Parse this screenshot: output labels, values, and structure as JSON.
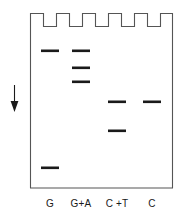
{
  "figure": {
    "colors": {
      "outline": "#555555",
      "band": "#1a1a1a",
      "arrow": "#1a1a1a",
      "label": "#1a1a1a",
      "background": "#ffffff"
    }
  },
  "gel": {
    "box": {
      "x": 30,
      "y": 13,
      "width": 143,
      "height": 175
    },
    "comb": {
      "teeth_count": 5,
      "notch_depth": 13,
      "description": "castellated well comb along top edge"
    }
  },
  "arrow": {
    "name": "migration-direction-arrow",
    "direction": "down",
    "x": 14,
    "y_top": 85,
    "y_bottom": 112
  },
  "lanes": [
    {
      "label": "G",
      "center_x": 50,
      "bands": [
        {
          "y": 51,
          "width": 18
        },
        {
          "y": 168,
          "width": 18
        }
      ]
    },
    {
      "label": "G+A",
      "center_x": 81,
      "bands": [
        {
          "y": 51,
          "width": 18
        },
        {
          "y": 68,
          "width": 18
        },
        {
          "y": 82,
          "width": 18
        }
      ]
    },
    {
      "label": "C +T",
      "center_x": 117,
      "bands": [
        {
          "y": 102,
          "width": 18
        },
        {
          "y": 131,
          "width": 18
        }
      ]
    },
    {
      "label": "C",
      "center_x": 152,
      "bands": [
        {
          "y": 102,
          "width": 18
        }
      ]
    }
  ],
  "labels_row": {
    "y": 204,
    "items": [
      {
        "text": "G",
        "center_x": 50
      },
      {
        "text": "G+A",
        "center_x": 81
      },
      {
        "text": "C +T",
        "center_x": 117
      },
      {
        "text": "C",
        "center_x": 152
      }
    ]
  }
}
